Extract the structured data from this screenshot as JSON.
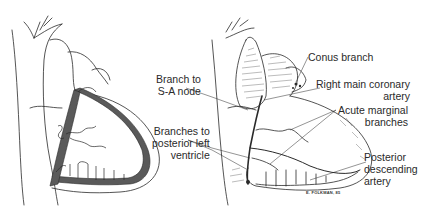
{
  "figure": {
    "panels": [
      {
        "id": "schematic",
        "description": "Schematic view of heart with right coronary artery highlighted"
      },
      {
        "id": "illustration",
        "description": "Shaded illustration of heart showing right coronary artery branches"
      }
    ],
    "colors": {
      "ink": "#2a2a2a",
      "artery_fill": "#5a5a5a",
      "background": "#ffffff"
    }
  },
  "labels": {
    "branch_sa_node": {
      "line1": "Branch to",
      "line2": "S-A node"
    },
    "branches_posterior_left": {
      "line1": "Branches to",
      "line2": "posterior left",
      "line3": "ventricle"
    },
    "conus_branch": {
      "line1": "Conus branch"
    },
    "right_main_coronary": {
      "line1": "Right main coronary",
      "line2": "artery"
    },
    "acute_marginal": {
      "line1": "Acute marginal",
      "line2": "branches"
    },
    "posterior_descending": {
      "line1": "Posterior",
      "line2": "descending",
      "line3": "artery"
    }
  },
  "signature": "E. FOLKMAN, 85"
}
